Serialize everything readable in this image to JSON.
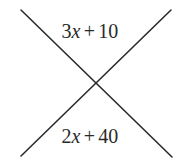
{
  "figure": {
    "type": "geometry-diagram",
    "background_color": "#ffffff",
    "stroke_color": "#2b2b2b",
    "text_color": "#2a2a2a",
    "stroke_width": 1.6,
    "canvas": {
      "width": 180,
      "height": 164
    },
    "intersection_point": {
      "x": 96,
      "y": 84
    },
    "lines": [
      {
        "name": "line-down-right",
        "x1": 21,
        "y1": 10,
        "x2": 172,
        "y2": 157
      },
      {
        "name": "line-up-right",
        "x1": 21,
        "y1": 156,
        "x2": 171,
        "y2": 10
      }
    ],
    "labels": {
      "top": {
        "full_text": "3x + 10",
        "coefficient": "3",
        "variable": "x",
        "operator": "+",
        "constant": "10",
        "position": {
          "x": 97,
          "y": 32
        }
      },
      "bottom": {
        "full_text": "2x + 40",
        "coefficient": "2",
        "variable": "x",
        "operator": "+",
        "constant": "40",
        "position": {
          "x": 97,
          "y": 137
        }
      }
    }
  }
}
